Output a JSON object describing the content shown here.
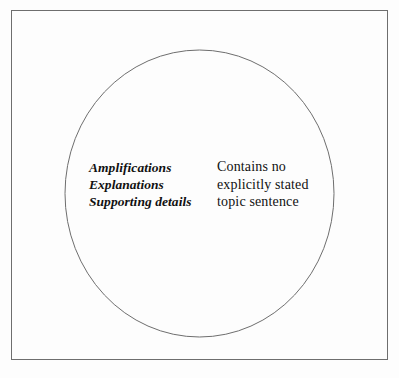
{
  "diagram": {
    "type": "circle-diagram",
    "background_color": "#fdfdfd",
    "frame": {
      "name": "outer-rectangle-border",
      "stroke_color": "#6e6e6e",
      "stroke_width": 1
    },
    "shape": {
      "name": "circle",
      "stroke_color": "#6e6e6e",
      "stroke_width": 1,
      "fill": "none",
      "center_x": 199.5,
      "center_y": 193.5,
      "radius_x": 134.5,
      "radius_y": 143.5
    },
    "labels": {
      "left": {
        "name": "supporting-details-label",
        "style": "bold-italic",
        "text_color": "#111111",
        "lines": [
          "Amplifications",
          "Explanations",
          "Supporting details"
        ]
      },
      "right": {
        "name": "topic-sentence-note-label",
        "style": "regular",
        "text_color": "#111111",
        "lines": [
          "Contains no",
          "explicitly stated",
          "topic sentence"
        ]
      }
    }
  }
}
